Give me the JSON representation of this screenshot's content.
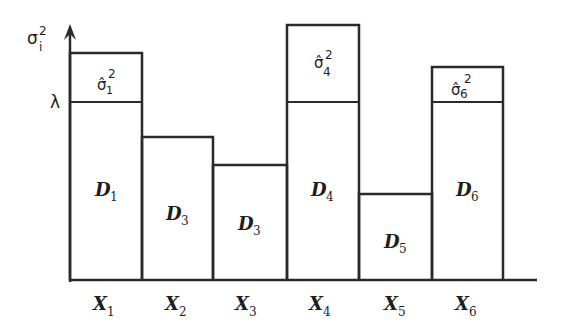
{
  "diagram": {
    "y_axis_label": {
      "base": "σ",
      "sub": "i",
      "sup": "2"
    },
    "threshold_label": "λ",
    "bars": [
      {
        "x_label": "X",
        "x_sub": "1",
        "d_label": "D",
        "d_sub": "1",
        "excess_label": {
          "base": "σ̂",
          "sub": "1",
          "sup": "2"
        },
        "exceeds_threshold": true
      },
      {
        "x_label": "X",
        "x_sub": "2",
        "d_label": "D",
        "d_sub": "3",
        "excess_label": null,
        "exceeds_threshold": false
      },
      {
        "x_label": "X",
        "x_sub": "3",
        "d_label": "D",
        "d_sub": "3",
        "excess_label": null,
        "exceeds_threshold": false
      },
      {
        "x_label": "X",
        "x_sub": "4",
        "d_label": "D",
        "d_sub": "4",
        "excess_label": {
          "base": "σ̂",
          "sub": "4",
          "sup": "2"
        },
        "exceeds_threshold": true
      },
      {
        "x_label": "X",
        "x_sub": "5",
        "d_label": "D",
        "d_sub": "5",
        "excess_label": null,
        "exceeds_threshold": false
      },
      {
        "x_label": "X",
        "x_sub": "6",
        "d_label": "D",
        "d_sub": "6",
        "excess_label": {
          "base": "σ̂",
          "sub": "6",
          "sup": "2"
        },
        "exceeds_threshold": true
      }
    ]
  }
}
